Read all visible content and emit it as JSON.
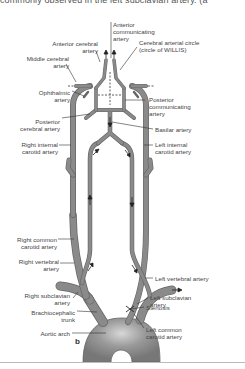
{
  "caption": "commonly observed in the left subclavian artery. (a",
  "panel_label": "b",
  "labels": {
    "anterior_communicating": [
      "Anterior",
      "communicating",
      "artery"
    ],
    "anterior_cerebral": [
      "Anterior cerebral",
      "artery"
    ],
    "cerebral_arterial_circle": [
      "Cerebral arterial circle",
      "(circle of WILLIS)"
    ],
    "middle_cerebral": [
      "Middle cerebral",
      "artery"
    ],
    "ophthalmic": [
      "Ophthalmic",
      "artery"
    ],
    "posterior_communicating": [
      "Posterior",
      "communicating",
      "artery"
    ],
    "posterior_cerebral": [
      "Posterior",
      "cerebral artery"
    ],
    "basilar": [
      "Basilar artery"
    ],
    "right_internal_carotid": [
      "Right internal",
      "carotid artery"
    ],
    "left_internal_carotid": [
      "Left internal",
      "carotid artery"
    ],
    "right_common_carotid": [
      "Right common",
      "carotid artery"
    ],
    "right_vertebral": [
      "Right vertebral",
      "artery"
    ],
    "left_vertebral": [
      "Left vertebral artery"
    ],
    "right_subclavian": [
      "Right subclavian",
      "artery"
    ],
    "left_subclavian": [
      "Left subclavian",
      "artery"
    ],
    "brachiocephalic": [
      "Brachiocephalic",
      "trunk"
    ],
    "stenosis": [
      "Stenosis"
    ],
    "aortic_arch": [
      "Aortic arch"
    ],
    "left_common_carotid": [
      "Left common",
      "carotid artery"
    ]
  },
  "colors": {
    "vessel": "#8a8a8a",
    "vessel_edge": "#5e5e5e",
    "text": "#444444",
    "leader": "#333333"
  }
}
